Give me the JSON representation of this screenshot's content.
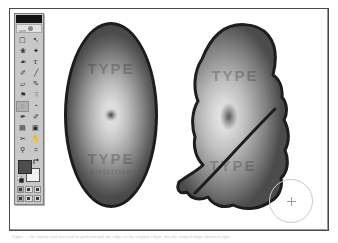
{
  "app": {
    "name": "Image Editor",
    "document_title": "Liquify distortion comparison"
  },
  "toolbox": {
    "title": "Toolbox",
    "titlebar_label": "",
    "logo_label": "jump-to",
    "tools": [
      {
        "name": "marquee-tool",
        "label": "Marquee",
        "glyph": "▢",
        "selected": false
      },
      {
        "name": "move-tool",
        "label": "Move",
        "glyph": "↖",
        "selected": false
      },
      {
        "name": "lasso-tool",
        "label": "Lasso",
        "glyph": "❀",
        "selected": false
      },
      {
        "name": "magic-wand-tool",
        "label": "Magic Wand",
        "glyph": "✦",
        "selected": false
      },
      {
        "name": "airbrush-tool",
        "label": "Airbrush",
        "glyph": "☙",
        "selected": false
      },
      {
        "name": "type-tool",
        "label": "Type",
        "glyph": "T",
        "selected": false
      },
      {
        "name": "paintbrush-tool",
        "label": "Paintbrush",
        "glyph": "✐",
        "selected": false
      },
      {
        "name": "line-tool",
        "label": "Line",
        "glyph": "╱",
        "selected": false
      },
      {
        "name": "eraser-tool",
        "label": "Eraser",
        "glyph": "▱",
        "selected": false
      },
      {
        "name": "pencil-tool",
        "label": "Pencil",
        "glyph": "✎",
        "selected": false
      },
      {
        "name": "rubber-stamp-tool",
        "label": "Rubber Stamp",
        "glyph": "⚑",
        "selected": false
      },
      {
        "name": "smudge-tool",
        "label": "Smudge",
        "glyph": "☟",
        "selected": false
      },
      {
        "name": "blur-tool",
        "label": "Blur",
        "glyph": "◌",
        "selected": true
      },
      {
        "name": "dodge-tool",
        "label": "Dodge / Burn",
        "glyph": "◔",
        "selected": false
      },
      {
        "name": "pen-tool",
        "label": "Pen",
        "glyph": "✒",
        "selected": false
      },
      {
        "name": "measure-tool",
        "label": "Measure",
        "glyph": "✐",
        "selected": false
      },
      {
        "name": "gradient-tool",
        "label": "Gradient",
        "glyph": "▤",
        "selected": false
      },
      {
        "name": "paint-bucket-tool",
        "label": "Paint Bucket",
        "glyph": "▣",
        "selected": false
      },
      {
        "name": "eyedropper-tool",
        "label": "Eyedropper",
        "glyph": "✂",
        "selected": false
      },
      {
        "name": "hand-tool",
        "label": "Hand",
        "glyph": "✋",
        "selected": false
      },
      {
        "name": "zoom-tool",
        "label": "Zoom",
        "glyph": "⚲",
        "selected": false
      },
      {
        "name": "crop-tool",
        "label": "Crop",
        "glyph": "⌗",
        "selected": false
      }
    ],
    "colors": {
      "foreground_label": "Foreground color",
      "foreground_hex": "#4d4d4d",
      "background_label": "Background color",
      "background_hex": "#f2f2f2",
      "swap_label": "Switch colors",
      "default_label": "Default colors"
    },
    "mask_modes": [
      {
        "name": "standard-mask-mode",
        "label": "Standard mode",
        "selected": true
      },
      {
        "name": "quick-mask-mode",
        "label": "Quick mask mode",
        "selected": false
      },
      {
        "name": "edit-mask-mode",
        "label": "Edit in mask",
        "selected": false
      }
    ],
    "screen_modes": [
      {
        "name": "standard-screen-mode",
        "label": "Standard screen",
        "selected": true
      },
      {
        "name": "full-screen-menubar",
        "label": "Full screen w/ menu",
        "selected": false
      },
      {
        "name": "full-screen-mode",
        "label": "Full screen",
        "selected": false
      }
    ]
  },
  "canvas": {
    "name": "artwork-canvas",
    "background_hex": "#ffffff",
    "border_hex": "#4a4a4a",
    "shapes": [
      {
        "name": "original-ellipse",
        "label": "Original ellipse with radial gradient",
        "outline_hex": "#1d1d1d",
        "watermark_top": "TYPE",
        "watermark_bottom": "TYPE",
        "watermark_sub": "distortion"
      },
      {
        "name": "liquified-shape",
        "label": "Liquified / distorted copy of the ellipse",
        "outline_hex": "#1d1d1d",
        "watermark_top": "TYPE",
        "watermark_bottom": "TYPE"
      }
    ],
    "cursor": {
      "name": "brush-cursor",
      "label": "Round brush cursor with crosshair",
      "diameter_px": 44
    }
  },
  "caption": {
    "text": "Figure — the liquify tool was used to push and pull the edges of the original ellipse into the warped shape shown at right."
  }
}
